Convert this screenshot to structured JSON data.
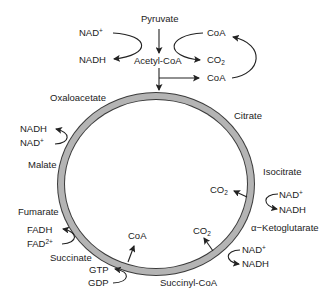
{
  "diagram": {
    "colors": {
      "ring_fill": "#b4b4b4",
      "ring_stroke": "#3a3a3a",
      "text": "#222222",
      "arrow": "#222222"
    },
    "entry": {
      "pyruvate": "Pyruvate",
      "acetyl_coa": "Acetyl-CoA",
      "nad_in": "NAD",
      "nad_in_sup": "+",
      "nadh_out": "NADH",
      "coa_in": "CoA",
      "co2_out": "CO",
      "co2_out_sub": "2",
      "coa_out": "CoA"
    },
    "intermediates": {
      "oxaloacetate": "Oxaloacetate",
      "citrate": "Citrate",
      "isocitrate": "Isocitrate",
      "alpha_ketoglutarate": "α−Ketoglutarate",
      "succinyl_coa": "Succinyl-CoA",
      "succinate": "Succinate",
      "fumarate": "Fumarate",
      "malate": "Malate"
    },
    "cofactors": {
      "malate_nadh": "NADH",
      "malate_nad": "NAD",
      "malate_nad_sup": "+",
      "isocitrate_co2": "CO",
      "isocitrate_co2_sub": "2",
      "isocitrate_nad": "NAD",
      "isocitrate_nad_sup": "+",
      "isocitrate_nadh": "NADH",
      "akg_co2": "CO",
      "akg_co2_sub": "2",
      "akg_nad": "NAD",
      "akg_nad_sup": "+",
      "akg_nadh": "NADH",
      "succinyl_coa_out": "CoA",
      "gtp": "GTP",
      "gdp": "GDP",
      "fadh": "FADH",
      "fad": "FAD",
      "fad_sup": "2+"
    }
  }
}
